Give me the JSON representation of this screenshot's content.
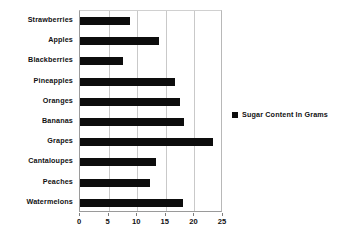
{
  "chart_data": {
    "type": "bar",
    "orientation": "horizontal",
    "title": "",
    "xlabel": "",
    "ylabel": "",
    "categories": [
      "Strawberries",
      "Apples",
      "Blackberries",
      "Pineapples",
      "Oranges",
      "Bananas",
      "Grapes",
      "Cantaloupes",
      "Peaches",
      "Watermelons"
    ],
    "series": [
      {
        "name": "Sugar Content In Grams",
        "color": "#0d0d0d",
        "values": [
          8.7,
          13.8,
          7.5,
          16.6,
          17.5,
          18.2,
          23.2,
          13.3,
          12.3,
          18.0
        ]
      }
    ],
    "xlim": [
      0,
      25
    ],
    "xticks": [
      0,
      5,
      10,
      15,
      20,
      25
    ],
    "xtick_labels": [
      "0",
      "5",
      "10",
      "15",
      "20",
      "25"
    ],
    "grid": true,
    "grid_axis": "x",
    "legend": {
      "position": "right",
      "entries": [
        {
          "label": "Sugar Content In Grams",
          "marker": "square",
          "color": "#0d0d0d"
        }
      ]
    }
  }
}
